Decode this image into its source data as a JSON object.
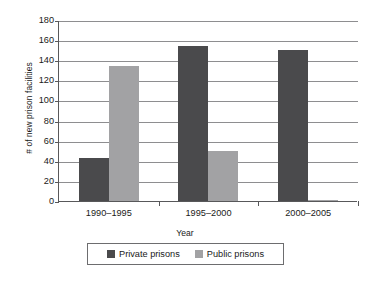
{
  "chart_data": {
    "type": "bar",
    "title": "",
    "xlabel": "Year",
    "ylabel": "# of new prison facilities",
    "categories": [
      "1990–1995",
      "1995–2000",
      "2000–2005"
    ],
    "series": [
      {
        "name": "Private prisons",
        "color": "#4a4a4c",
        "values": [
          43,
          154,
          150
        ]
      },
      {
        "name": "Public prisons",
        "color": "#a2a2a4",
        "values": [
          134,
          50,
          1
        ]
      }
    ],
    "ylim": [
      0,
      180
    ],
    "ytick_step": 20,
    "yticks": [
      0,
      20,
      40,
      60,
      80,
      100,
      120,
      140,
      160,
      180
    ],
    "ytick_labels": [
      "0",
      "20",
      "40",
      "60",
      "80",
      "100",
      "120",
      "140",
      "160",
      "180"
    ],
    "grid": "horizontal",
    "legend_position": "bottom-center",
    "legend_entries": [
      "Private prisons",
      "Public prisons"
    ]
  },
  "axes": {
    "y_title": "# of new prison facilities",
    "x_title": "Year"
  }
}
